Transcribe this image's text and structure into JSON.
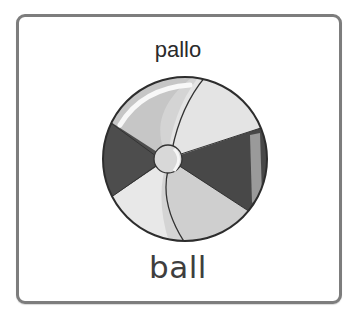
{
  "card": {
    "word_finnish": "pallo",
    "word_english": "ball",
    "image": {
      "icon": "beach-ball-icon",
      "description": "beach ball"
    }
  },
  "colors": {
    "border": "#7d7d7d",
    "text": "#2a2a2a",
    "ball_dark": "#4a4a4a",
    "ball_mid": "#c9c9c9",
    "ball_light": "#e6e6e6"
  }
}
